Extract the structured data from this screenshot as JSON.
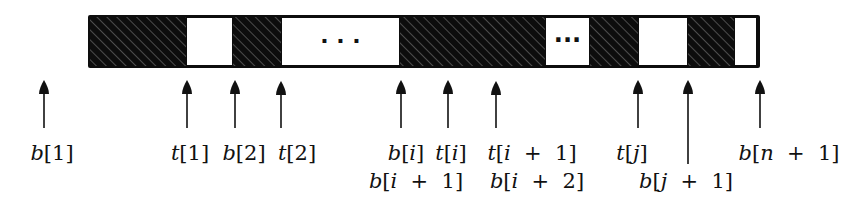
{
  "diagram": {
    "colors": {
      "filled": "#0d0d0d",
      "empty": "#ffffff",
      "hatch": "#8a8a8a",
      "ink": "#111111"
    },
    "bar": {
      "x": 88,
      "y": 15,
      "width": 672,
      "height": 53
    },
    "segments": [
      {
        "type": "filled",
        "x0": 90,
        "x1": 186
      },
      {
        "type": "empty",
        "x0": 186,
        "x1": 233
      },
      {
        "type": "filled",
        "x0": 233,
        "x1": 281
      },
      {
        "type": "empty",
        "x0": 281,
        "x1": 400,
        "ellipsis": "· · ·"
      },
      {
        "type": "filled",
        "x0": 400,
        "x1": 545
      },
      {
        "type": "empty",
        "x0": 545,
        "x1": 590,
        "ellipsis": "···"
      },
      {
        "type": "filled",
        "x0": 590,
        "x1": 638
      },
      {
        "type": "empty",
        "x0": 638,
        "x1": 688
      },
      {
        "type": "filled",
        "x0": 688,
        "x1": 734
      },
      {
        "type": "empty",
        "x0": 734,
        "x1": 757
      }
    ],
    "pointers": [
      {
        "x": 44,
        "tip": 80,
        "tail": 128,
        "row": 1,
        "label": "b[1]"
      },
      {
        "x": 187,
        "tip": 80,
        "tail": 128,
        "row": 1,
        "label": "t[1]"
      },
      {
        "x": 235,
        "tip": 80,
        "tail": 128,
        "row": 1,
        "label": "b[2]"
      },
      {
        "x": 281,
        "tip": 81,
        "tail": 128,
        "row": 1,
        "label": "t[2]"
      },
      {
        "x": 401,
        "tip": 80,
        "tail": 128,
        "row": 1,
        "label": "b[i]",
        "label2": "b[i + 1]"
      },
      {
        "x": 448,
        "tip": 80,
        "tail": 128,
        "row": 1,
        "label": "t[i]"
      },
      {
        "x": 496,
        "tip": 81,
        "tail": 128,
        "row": 1,
        "label": "t[i + 1]",
        "label2": "b[i + 2]"
      },
      {
        "x": 638,
        "tip": 80,
        "tail": 128,
        "row": 1,
        "label": "t[j]"
      },
      {
        "x": 688,
        "tip": 80,
        "tail": 164,
        "row": 2,
        "label": "b[j + 1]"
      },
      {
        "x": 760,
        "tip": 80,
        "tail": 128,
        "row": 1,
        "label": "b[n + 1]"
      }
    ],
    "labels": [
      {
        "x": 52,
        "y": 143,
        "text": "b[1]"
      },
      {
        "x": 190,
        "y": 143,
        "text": "t[1]"
      },
      {
        "x": 244,
        "y": 143,
        "text": "b[2]"
      },
      {
        "x": 297,
        "y": 143,
        "text": "t[2]"
      },
      {
        "x": 406,
        "y": 143,
        "text": "b[i]"
      },
      {
        "x": 451,
        "y": 143,
        "text": "t[i]"
      },
      {
        "x": 532,
        "y": 143,
        "text": "t[i + 1]"
      },
      {
        "x": 632,
        "y": 143,
        "text": "t[j]"
      },
      {
        "x": 789,
        "y": 143,
        "text": "b[n + 1]"
      },
      {
        "x": 416,
        "y": 171,
        "text": "b[i + 1]"
      },
      {
        "x": 537,
        "y": 171,
        "text": "b[i + 2]"
      },
      {
        "x": 686,
        "y": 171,
        "text": "b[j + 1]"
      }
    ]
  }
}
